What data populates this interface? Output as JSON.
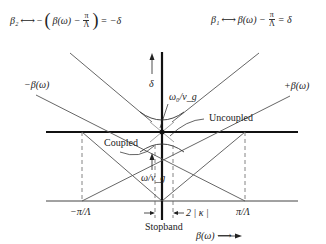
{
  "equations": {
    "left": {
      "lhs": "β₂",
      "arrow": "⟷",
      "minus": "−",
      "open": "(",
      "term": "β(ω) −",
      "frac_num": "π",
      "frac_den": "Λ",
      "close": ")",
      "rhs": "= −δ"
    },
    "right": {
      "lhs": "β₁",
      "arrow": "⟷",
      "term": "β(ω) −",
      "frac_num": "π",
      "frac_den": "Λ",
      "rhs": "= δ"
    }
  },
  "labels": {
    "neg_beta": "−β(ω)",
    "pos_beta": "+β(ω)",
    "delta_axis": "δ",
    "omega0_vg": "ω₀/v_g",
    "uncoupled": "Uncoupled",
    "coupled": "Coupled",
    "omega_vg": "ω/v_g",
    "neg_pi_lambda": "−π/Λ",
    "pi_lambda": "π/Λ",
    "two_kappa": "2 | κ |",
    "stopband": "Stopband",
    "beta_axis": "β(ω) ⟶"
  },
  "colors": {
    "line": "#555555",
    "axis": "#111111",
    "dash": "#666666"
  }
}
